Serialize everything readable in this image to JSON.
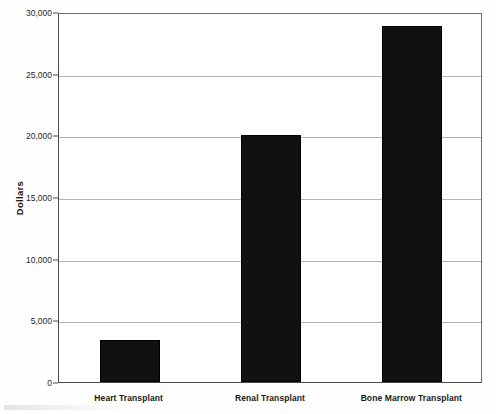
{
  "chart_data": {
    "type": "bar",
    "title": "",
    "subtitle": "",
    "xlabel": "",
    "ylabel": "Dollars",
    "categories": [
      "Heart Transplant",
      "Renal Transplant",
      "Bone Marrow Transplant"
    ],
    "values": [
      3400,
      20000,
      28900
    ],
    "series": [
      {
        "name": "Cost",
        "values": [
          3400,
          20000,
          28900
        ]
      }
    ],
    "ylim": [
      0,
      30000
    ],
    "ytick_values": [
      0,
      5000,
      10000,
      15000,
      20000,
      25000,
      30000
    ],
    "ytick_labels": [
      "0",
      "5,000",
      "10,000",
      "15,000",
      "20,000",
      "25,000",
      "30,000"
    ],
    "grid": "horizontal",
    "legend": "none",
    "bar_color": "#111111",
    "gridline_color": "#b4b4b4",
    "axis_color": "#4a4a4a",
    "background_color": "#ffffff"
  },
  "axes": {
    "y_title": "Dollars"
  }
}
